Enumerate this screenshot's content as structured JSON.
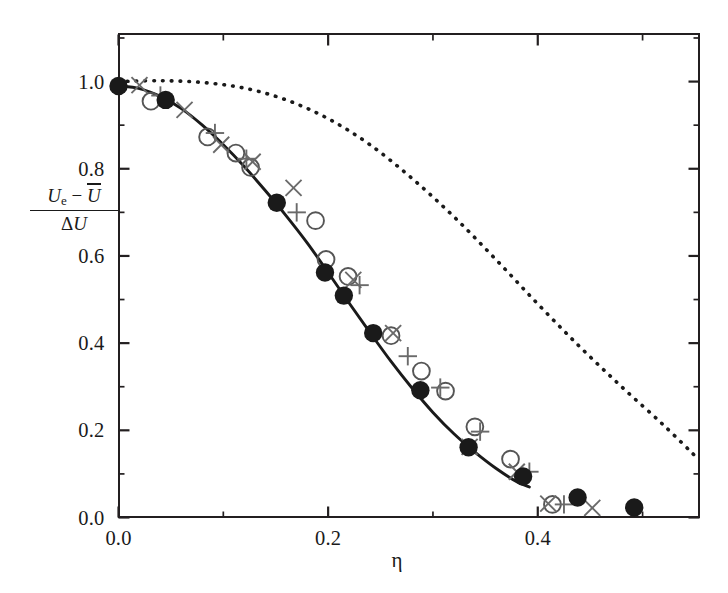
{
  "chart_data": {
    "type": "scatter",
    "title": "",
    "xlabel": "η",
    "ylabel_numerator": "Uₑ − U̅",
    "ylabel_denominator": "ΔU",
    "xlim": [
      0.0,
      0.5543
    ],
    "ylim": [
      0.0,
      1.108
    ],
    "grid": false,
    "legend": "none",
    "xticks_major": [
      0.0,
      0.2,
      0.4
    ],
    "xticks_major_labels": [
      "0.0",
      "0.2",
      "0.4"
    ],
    "xticks_minor": [
      0.1,
      0.3,
      0.5
    ],
    "yticks_major": [
      0.0,
      0.2,
      0.4,
      0.6,
      0.8,
      1.0
    ],
    "yticks_major_labels": [
      "0.0",
      "0.2",
      "0.4",
      "0.6",
      "0.8",
      "1.0"
    ],
    "yticks_minor": [
      0.1,
      0.3,
      0.5,
      0.7,
      0.9,
      1.1
    ],
    "series": [
      {
        "name": "filled-circle-data",
        "marker": "filled-circle",
        "color": "#1a1a1a",
        "x": [
          0.0,
          0.045,
          0.151,
          0.197,
          0.215,
          0.243,
          0.288,
          0.334,
          0.386,
          0.438,
          0.492
        ],
        "y": [
          0.99,
          0.958,
          0.722,
          0.562,
          0.509,
          0.423,
          0.292,
          0.161,
          0.094,
          0.046,
          0.023
        ]
      },
      {
        "name": "open-circle-data",
        "marker": "open-circle",
        "color": "#555555",
        "x": [
          0.031,
          0.085,
          0.112,
          0.126,
          0.188,
          0.198,
          0.219,
          0.26,
          0.289,
          0.312,
          0.34,
          0.374,
          0.414
        ],
        "y": [
          0.955,
          0.873,
          0.836,
          0.803,
          0.681,
          0.592,
          0.553,
          0.417,
          0.336,
          0.29,
          0.208,
          0.134,
          0.03
        ]
      },
      {
        "name": "cross-x-data",
        "marker": "x",
        "color": "#6a6a6a",
        "x": [
          0.02,
          0.063,
          0.098,
          0.128,
          0.167,
          0.224,
          0.262,
          0.335,
          0.38,
          0.41,
          0.452
        ],
        "y": [
          0.992,
          0.935,
          0.855,
          0.816,
          0.756,
          0.545,
          0.423,
          0.162,
          0.105,
          0.032,
          0.022
        ]
      },
      {
        "name": "plus-data",
        "marker": "plus",
        "color": "#6a6a6a",
        "x": [
          0.04,
          0.092,
          0.122,
          0.17,
          0.23,
          0.276,
          0.307,
          0.345,
          0.392,
          0.425
        ],
        "y": [
          0.968,
          0.882,
          0.823,
          0.7,
          0.533,
          0.37,
          0.298,
          0.197,
          0.105,
          0.03
        ]
      }
    ],
    "curves": [
      {
        "name": "solid-fit-curve",
        "style": "solid",
        "color": "#1a1a1a",
        "x": [
          0.0,
          0.02,
          0.04,
          0.06,
          0.08,
          0.1,
          0.12,
          0.14,
          0.16,
          0.18,
          0.2,
          0.22,
          0.24,
          0.26,
          0.28,
          0.3,
          0.32,
          0.34,
          0.36,
          0.38,
          0.392
        ],
        "y": [
          0.99,
          0.984,
          0.966,
          0.938,
          0.9,
          0.855,
          0.805,
          0.75,
          0.692,
          0.63,
          0.562,
          0.492,
          0.424,
          0.358,
          0.297,
          0.241,
          0.192,
          0.15,
          0.113,
          0.082,
          0.07
        ]
      },
      {
        "name": "dotted-model-curve",
        "style": "dotted",
        "color": "#1a1a1a",
        "x": [
          0.0,
          0.04,
          0.08,
          0.12,
          0.16,
          0.2,
          0.24,
          0.28,
          0.32,
          0.36,
          0.4,
          0.44,
          0.48,
          0.52,
          0.554
        ],
        "y": [
          1.0,
          1.002,
          0.998,
          0.985,
          0.958,
          0.915,
          0.855,
          0.778,
          0.69,
          0.592,
          0.49,
          0.392,
          0.3,
          0.212,
          0.132
        ]
      }
    ]
  },
  "axes": {
    "x_title": "η",
    "y_title_numerator_main": "U",
    "y_title_numerator_sub": "e",
    "y_title_numerator_minus": "−",
    "y_title_numerator_mean": "U",
    "y_title_denominator_delta": "Δ",
    "y_title_denominator_U": "U"
  }
}
